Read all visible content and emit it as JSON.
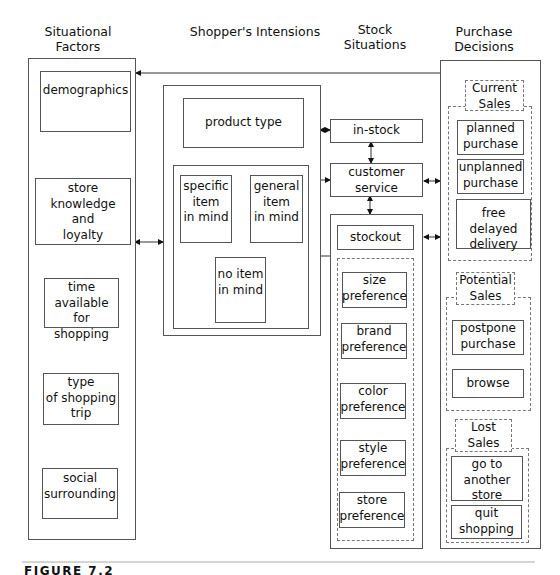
{
  "headers": {
    "situational": "Situational Factors",
    "shopper": "Shopper's Intensions",
    "stock": "Stock\nSituations",
    "purchase": "Purchase\nDecisions"
  },
  "situational_factors": [
    "demographics",
    "store\nknowledge\nand\nloyalty",
    "time\navailable for\nshopping",
    "type\nof shopping\ntrip",
    "social\nsurrounding"
  ],
  "shopper_intensions": {
    "product_type": "product type",
    "specific": "specific\nitem\nin mind",
    "general": "general\nitem\nin mind",
    "no_item": "no item\nin mind"
  },
  "stock_situations": {
    "in_stock": "in-stock",
    "customer_service": "customer\nservice",
    "stockout": "stockout",
    "preferences": [
      "size\npreference",
      "brand\npreference",
      "color\npreference",
      "style\npreference",
      "store\npreference"
    ]
  },
  "purchase_decisions": {
    "current_sales": {
      "label": "Current\nSales",
      "items": [
        "planned\npurchase",
        "unplanned\npurchase",
        "free delayed\ndelivery"
      ]
    },
    "potential_sales": {
      "label": "Potential\nSales",
      "items": [
        "postpone\npurchase",
        "browse"
      ]
    },
    "lost_sales": {
      "label": "Lost\nSales",
      "items": [
        "go to\nanother\nstore",
        "quit\nshopping"
      ]
    }
  },
  "figure_caption": "FIGURE 7.2",
  "colors": {
    "line": "#555555",
    "dashed": "#777777",
    "text": "#111111"
  }
}
